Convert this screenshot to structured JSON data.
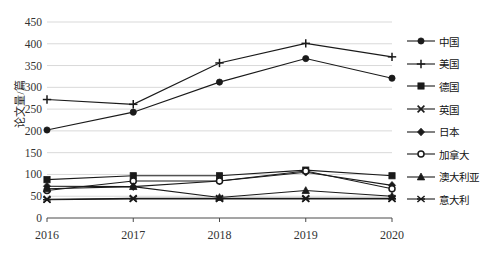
{
  "chart_data": {
    "type": "line",
    "title": "",
    "xlabel": "",
    "ylabel": "论文量/篇",
    "categories": [
      "2016",
      "2017",
      "2018",
      "2019",
      "2020"
    ],
    "x": [
      2016,
      2017,
      2018,
      2019,
      2020
    ],
    "ylim": [
      0,
      450
    ],
    "ytick_step": 50,
    "yticks": [
      "0",
      "50",
      "100",
      "150",
      "200",
      "250",
      "300",
      "350",
      "400",
      "450"
    ],
    "grid": "horizontal",
    "legend_position": "right",
    "line_color": "#1a1a1a",
    "grid_color": "#d9d9d9",
    "series": [
      {
        "name": "中国",
        "marker": "circle",
        "values": [
          202,
          243,
          312,
          366,
          321
        ]
      },
      {
        "name": "美国",
        "marker": "plus",
        "values": [
          272,
          261,
          356,
          401,
          370
        ]
      },
      {
        "name": "德国",
        "marker": "square",
        "values": [
          88,
          97,
          97,
          110,
          97
        ]
      },
      {
        "name": "英国",
        "marker": "x",
        "values": [
          43,
          45,
          45,
          45,
          45
        ]
      },
      {
        "name": "日本",
        "marker": "diamond",
        "values": [
          73,
          72,
          85,
          105,
          75
        ]
      },
      {
        "name": "加拿大",
        "marker": "open-circle",
        "values": [
          63,
          85,
          85,
          108,
          67
        ]
      },
      {
        "name": "澳大利亚",
        "marker": "triangle",
        "values": [
          67,
          72,
          47,
          63,
          50
        ]
      },
      {
        "name": "意大利",
        "marker": "star",
        "values": [
          42,
          44,
          44,
          44,
          44
        ]
      }
    ]
  }
}
